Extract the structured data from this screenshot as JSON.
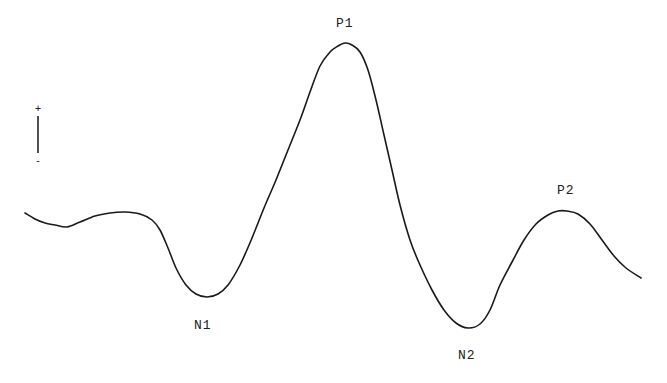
{
  "diagram": {
    "type": "waveform",
    "stroke_color": "#1a1a1a",
    "background_color": "#ffffff",
    "polarity_scale": {
      "top_sign": "+",
      "bottom_sign": "-"
    },
    "peaks": [
      {
        "id": "N1",
        "label": "N1",
        "x": 207,
        "y": 297,
        "kind": "negative"
      },
      {
        "id": "P1",
        "label": "P1",
        "x": 345,
        "y": 43,
        "kind": "positive"
      },
      {
        "id": "N2",
        "label": "N2",
        "x": 468,
        "y": 328,
        "kind": "negative"
      },
      {
        "id": "P2",
        "label": "P2",
        "x": 567,
        "y": 211,
        "kind": "positive"
      }
    ],
    "trace_points": [
      [
        25,
        213
      ],
      [
        35,
        219
      ],
      [
        45,
        223
      ],
      [
        55,
        225
      ],
      [
        67,
        227
      ],
      [
        80,
        222
      ],
      [
        95,
        216
      ],
      [
        110,
        213
      ],
      [
        125,
        212
      ],
      [
        140,
        214
      ],
      [
        152,
        220
      ],
      [
        160,
        230
      ],
      [
        168,
        248
      ],
      [
        176,
        268
      ],
      [
        186,
        285
      ],
      [
        196,
        294
      ],
      [
        207,
        297
      ],
      [
        218,
        294
      ],
      [
        228,
        285
      ],
      [
        240,
        265
      ],
      [
        252,
        238
      ],
      [
        264,
        208
      ],
      [
        276,
        180
      ],
      [
        288,
        150
      ],
      [
        300,
        120
      ],
      [
        310,
        92
      ],
      [
        320,
        66
      ],
      [
        330,
        52
      ],
      [
        338,
        46
      ],
      [
        345,
        43
      ],
      [
        352,
        45
      ],
      [
        360,
        52
      ],
      [
        368,
        70
      ],
      [
        376,
        100
      ],
      [
        384,
        135
      ],
      [
        392,
        170
      ],
      [
        400,
        205
      ],
      [
        410,
        240
      ],
      [
        420,
        265
      ],
      [
        432,
        290
      ],
      [
        444,
        310
      ],
      [
        456,
        323
      ],
      [
        468,
        328
      ],
      [
        480,
        324
      ],
      [
        490,
        310
      ],
      [
        500,
        285
      ],
      [
        512,
        262
      ],
      [
        524,
        240
      ],
      [
        536,
        224
      ],
      [
        548,
        215
      ],
      [
        558,
        211
      ],
      [
        567,
        211
      ],
      [
        578,
        214
      ],
      [
        590,
        224
      ],
      [
        602,
        240
      ],
      [
        614,
        256
      ],
      [
        626,
        268
      ],
      [
        641,
        278
      ]
    ]
  }
}
